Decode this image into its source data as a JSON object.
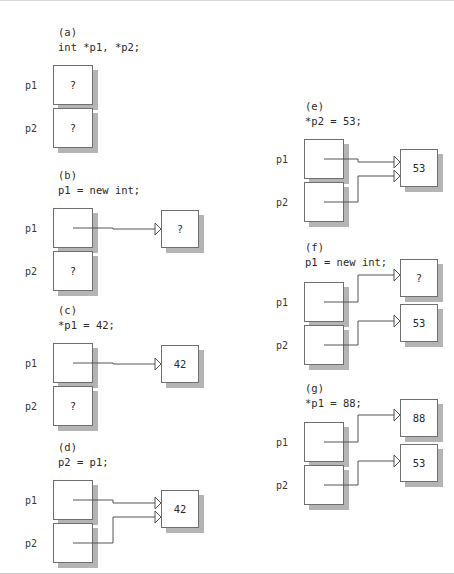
{
  "figure": {
    "title_present": false,
    "background": "#ffffff",
    "box_border_color": "#6f6f6f",
    "box_shadow_color": "#b4b4b4",
    "wire_color": "#555555"
  },
  "panels": [
    {
      "id": "a",
      "tag": "(a)",
      "code": "int *p1, *p2;",
      "pointers": [
        {
          "name": "p1",
          "value": "?",
          "points_to": null
        },
        {
          "name": "p2",
          "value": "?",
          "points_to": null
        }
      ],
      "heap_cells": []
    },
    {
      "id": "b",
      "tag": "(b)",
      "code": "p1 = new int;",
      "pointers": [
        {
          "name": "p1",
          "value": "",
          "points_to": "cell1"
        },
        {
          "name": "p2",
          "value": "?",
          "points_to": null
        }
      ],
      "heap_cells": [
        {
          "id": "cell1",
          "value": "?"
        }
      ]
    },
    {
      "id": "c",
      "tag": "(c)",
      "code": "*p1 = 42;",
      "pointers": [
        {
          "name": "p1",
          "value": "",
          "points_to": "cell1"
        },
        {
          "name": "p2",
          "value": "?",
          "points_to": null
        }
      ],
      "heap_cells": [
        {
          "id": "cell1",
          "value": "42"
        }
      ]
    },
    {
      "id": "d",
      "tag": "(d)",
      "code": "p2 = p1;",
      "pointers": [
        {
          "name": "p1",
          "value": "",
          "points_to": "cell1"
        },
        {
          "name": "p2",
          "value": "",
          "points_to": "cell1"
        }
      ],
      "heap_cells": [
        {
          "id": "cell1",
          "value": "42"
        }
      ]
    },
    {
      "id": "e",
      "tag": "(e)",
      "code": "*p2 = 53;",
      "pointers": [
        {
          "name": "p1",
          "value": "",
          "points_to": "cell1"
        },
        {
          "name": "p2",
          "value": "",
          "points_to": "cell1"
        }
      ],
      "heap_cells": [
        {
          "id": "cell1",
          "value": "53"
        }
      ]
    },
    {
      "id": "f",
      "tag": "(f)",
      "code": "p1 = new int;",
      "pointers": [
        {
          "name": "p1",
          "value": "",
          "points_to": "cell1"
        },
        {
          "name": "p2",
          "value": "",
          "points_to": "cell2"
        }
      ],
      "heap_cells": [
        {
          "id": "cell1",
          "value": "?"
        },
        {
          "id": "cell2",
          "value": "53"
        }
      ]
    },
    {
      "id": "g",
      "tag": "(g)",
      "code": "*p1 = 88;",
      "pointers": [
        {
          "name": "p1",
          "value": "",
          "points_to": "cell1"
        },
        {
          "name": "p2",
          "value": "",
          "points_to": "cell2"
        }
      ],
      "heap_cells": [
        {
          "id": "cell1",
          "value": "88"
        },
        {
          "id": "cell2",
          "value": "53"
        }
      ]
    }
  ]
}
